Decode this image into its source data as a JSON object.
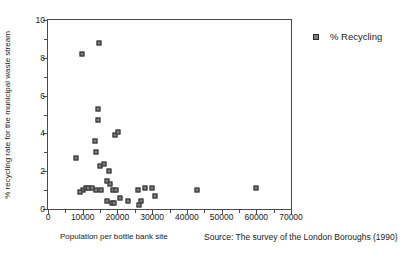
{
  "chart_data": {
    "type": "scatter",
    "title": "",
    "xlabel": "Population per bottle bank site",
    "ylabel": "% recycling rate for the municipal waste stream",
    "xlim": [
      0,
      70000
    ],
    "ylim": [
      0,
      10
    ],
    "grid": false,
    "legend_position": "right",
    "xticks": [
      0,
      10000,
      20000,
      30000,
      40000,
      50000,
      60000,
      70000
    ],
    "xtick_labels": [
      "0",
      "10000",
      "20000",
      "30000",
      "40000",
      "50000",
      "60000",
      "70000"
    ],
    "xticks_minor": [
      5000,
      15000,
      25000,
      35000,
      45000,
      55000,
      65000
    ],
    "yticks": [
      0,
      2,
      4,
      6,
      8,
      10
    ],
    "ytick_labels": [
      "0",
      "2",
      "4",
      "6",
      "8",
      "10"
    ],
    "yticks_minor": [
      1,
      3,
      5,
      7,
      9
    ],
    "series": [
      {
        "name": "% Recycling",
        "marker": "square",
        "color": "#7e7e7e",
        "edge_color": "#2b2b2b",
        "points": [
          {
            "x": 9700,
            "y": 8.2
          },
          {
            "x": 14600,
            "y": 8.8
          },
          {
            "x": 14300,
            "y": 5.3
          },
          {
            "x": 14300,
            "y": 4.7
          },
          {
            "x": 13400,
            "y": 3.6
          },
          {
            "x": 13700,
            "y": 3.0
          },
          {
            "x": 8000,
            "y": 2.7
          },
          {
            "x": 15100,
            "y": 2.3
          },
          {
            "x": 19400,
            "y": 3.9
          },
          {
            "x": 20300,
            "y": 4.1
          },
          {
            "x": 17700,
            "y": 2.0
          },
          {
            "x": 12600,
            "y": 1.1
          },
          {
            "x": 13700,
            "y": 1.0
          },
          {
            "x": 15400,
            "y": 1.0
          },
          {
            "x": 16900,
            "y": 1.5
          },
          {
            "x": 18000,
            "y": 1.3
          },
          {
            "x": 18600,
            "y": 1.0
          },
          {
            "x": 19700,
            "y": 1.0
          },
          {
            "x": 17100,
            "y": 0.4
          },
          {
            "x": 18300,
            "y": 0.3
          },
          {
            "x": 19100,
            "y": 0.3
          },
          {
            "x": 10000,
            "y": 1.0
          },
          {
            "x": 10900,
            "y": 1.1
          },
          {
            "x": 11400,
            "y": 1.1
          },
          {
            "x": 9100,
            "y": 0.9
          },
          {
            "x": 16000,
            "y": 2.4
          },
          {
            "x": 20600,
            "y": 0.6
          },
          {
            "x": 23100,
            "y": 0.4
          },
          {
            "x": 26000,
            "y": 1.0
          },
          {
            "x": 26900,
            "y": 0.4
          },
          {
            "x": 26300,
            "y": 0.2
          },
          {
            "x": 28000,
            "y": 1.1
          },
          {
            "x": 30000,
            "y": 1.1
          },
          {
            "x": 30900,
            "y": 0.7
          },
          {
            "x": 42900,
            "y": 1.0
          },
          {
            "x": 60000,
            "y": 1.1
          }
        ]
      }
    ],
    "annotations": [
      {
        "name": "source",
        "text": "Source: The survey of the London Boroughs (1990)"
      }
    ]
  },
  "legend": {
    "items": [
      {
        "label": "% Recycling"
      }
    ]
  },
  "footer": {
    "source": "Source: The survey of the London Boroughs (1990)"
  }
}
